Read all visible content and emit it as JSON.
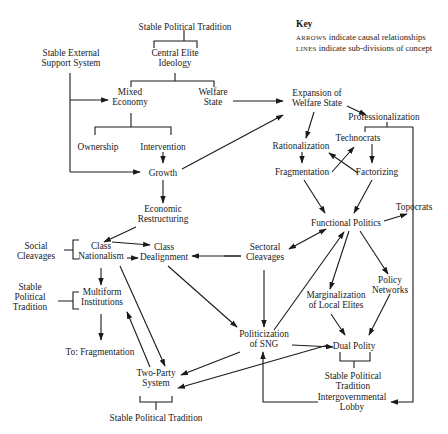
{
  "key": {
    "title": "Key",
    "lines": [
      {
        "term": "ARROWS",
        "desc": " indicate causal relationships"
      },
      {
        "term": "LINES",
        "desc": " indicate sub-divisions of concept"
      }
    ]
  },
  "nodes": [
    {
      "id": "stable_political_tradition_top",
      "lines": [
        "Stable Political Tradition"
      ],
      "x": 185,
      "y": 27
    },
    {
      "id": "central_elite_ideology",
      "lines": [
        "Central Elite",
        "Ideology"
      ],
      "x": 175,
      "y": 58
    },
    {
      "id": "stable_external_support",
      "lines": [
        "Stable External",
        "Support System"
      ],
      "x": 71,
      "y": 58
    },
    {
      "id": "mixed_economy",
      "lines": [
        "Mixed",
        "Economy"
      ],
      "x": 130,
      "y": 97
    },
    {
      "id": "welfare_state",
      "lines": [
        "Welfare",
        "State"
      ],
      "x": 213,
      "y": 97
    },
    {
      "id": "ownership",
      "lines": [
        "Ownership"
      ],
      "x": 98,
      "y": 147
    },
    {
      "id": "intervention",
      "lines": [
        "Intervention"
      ],
      "x": 163,
      "y": 147
    },
    {
      "id": "growth",
      "lines": [
        "Growth"
      ],
      "x": 163,
      "y": 173
    },
    {
      "id": "economic_restructuring",
      "lines": [
        "Economic",
        "Restructuring"
      ],
      "x": 163,
      "y": 214
    },
    {
      "id": "social_cleavages",
      "lines": [
        "Social",
        "Cleavages"
      ],
      "x": 36,
      "y": 251
    },
    {
      "id": "class_nationalism",
      "lines": [
        "Class",
        "Nationalism"
      ],
      "x": 101,
      "y": 251
    },
    {
      "id": "class_dealignment",
      "lines": [
        "Class",
        "Dealignment"
      ],
      "x": 164,
      "y": 252
    },
    {
      "id": "stable_political_tradition_left",
      "lines": [
        "Stable",
        "Political",
        "Tradition"
      ],
      "x": 30,
      "y": 297
    },
    {
      "id": "multiform_institutions",
      "lines": [
        "Multiform",
        "Institutions"
      ],
      "x": 102,
      "y": 297
    },
    {
      "id": "to_fragmentation",
      "lines": [
        "To: Fragmentation"
      ],
      "x": 100,
      "y": 352
    },
    {
      "id": "two_party_system",
      "lines": [
        "Two-Party",
        "System"
      ],
      "x": 156,
      "y": 378
    },
    {
      "id": "stable_political_tradition_bottom",
      "lines": [
        "Stable Political Tradition"
      ],
      "x": 156,
      "y": 418
    },
    {
      "id": "expansion_welfare_state",
      "lines": [
        "Expansion of",
        "Welfare State"
      ],
      "x": 317,
      "y": 98
    },
    {
      "id": "professionalization",
      "lines": [
        "Professionalization"
      ],
      "x": 384,
      "y": 117
    },
    {
      "id": "technocrats",
      "lines": [
        "Technocrats"
      ],
      "x": 358,
      "y": 138
    },
    {
      "id": "rationalization",
      "lines": [
        "Rationalization"
      ],
      "x": 301,
      "y": 146
    },
    {
      "id": "fragmentation",
      "lines": [
        "Fragmentation"
      ],
      "x": 302,
      "y": 172
    },
    {
      "id": "factorizing",
      "lines": [
        "Factorizing"
      ],
      "x": 377,
      "y": 172
    },
    {
      "id": "topocrats",
      "lines": [
        "Topocrats"
      ],
      "x": 414,
      "y": 207
    },
    {
      "id": "functional_politics",
      "lines": [
        "Functional Politics"
      ],
      "x": 346,
      "y": 223
    },
    {
      "id": "sectoral_cleavages",
      "lines": [
        "Sectoral",
        "Cleavages"
      ],
      "x": 265,
      "y": 252
    },
    {
      "id": "policy_networks",
      "lines": [
        "Policy",
        "Networks"
      ],
      "x": 390,
      "y": 285
    },
    {
      "id": "marginalization_local_elites",
      "lines": [
        "Marginalization",
        "of Local Elites"
      ],
      "x": 336,
      "y": 300
    },
    {
      "id": "politicization_sng",
      "lines": [
        "Politicization",
        "of SNG"
      ],
      "x": 264,
      "y": 339
    },
    {
      "id": "dual_polity",
      "lines": [
        "Dual Polity"
      ],
      "x": 354,
      "y": 346
    },
    {
      "id": "stable_political_tradition_right",
      "lines": [
        "Stable Political",
        "Tradition"
      ],
      "x": 353,
      "y": 381
    },
    {
      "id": "intergovernmental_lobby",
      "lines": [
        "Intergovernmental",
        "Lobby"
      ],
      "x": 352,
      "y": 402
    }
  ],
  "arrows": [
    {
      "from": "stable_external_support",
      "to": "mixed_economy",
      "path": "M70,100 L108,100"
    },
    {
      "from": "stable_external_support",
      "to": "growth",
      "path": "M70,172 L140,172"
    },
    {
      "from": "welfare_state",
      "to": "expansion_welfare_state",
      "path": "M233,101 L283,101"
    },
    {
      "from": "intervention",
      "to": "growth",
      "path": "M163,152 L163,163"
    },
    {
      "from": "growth",
      "to": "expansion_welfare_state",
      "path": "M182,169 L283,115"
    },
    {
      "from": "growth",
      "to": "economic_restructuring",
      "path": "M163,180 L163,203"
    },
    {
      "from": "economic_restructuring",
      "to": "class_nationalism",
      "path": "M136,227 L104,242"
    },
    {
      "from": "class_nationalism",
      "to": "class_dealignment",
      "path": "M112,242 L150,245"
    },
    {
      "from": "class_nationalism",
      "to": "class_dealignment",
      "path": "M127,258 L138,258"
    },
    {
      "from": "sectoral_cleavages",
      "to": "class_dealignment",
      "path": "M241,256 L192,256"
    },
    {
      "from": "class_nationalism",
      "to": "multiform_institutions",
      "path": "M101,268 L101,285"
    },
    {
      "from": "multiform_institutions",
      "to": "to_fragmentation",
      "path": "M101,314 L101,340"
    },
    {
      "from": "class_nationalism",
      "to": "two_party_system",
      "path": "M120,266 L165,366"
    },
    {
      "from": "two_party_system",
      "to": "multiform_institutions",
      "path": "M150,367 L127,312"
    },
    {
      "from": "class_dealignment",
      "to": "politicization_sng",
      "path": "M168,266 L237,327"
    },
    {
      "from": "politicization_sng",
      "to": "two_party_system",
      "path": "M240,352 L181,375"
    },
    {
      "from": "dual_polity",
      "to": "two_party_system",
      "path": "M328,345 L178,388"
    },
    {
      "from": "expansion_welfare_state",
      "to": "professionalization",
      "path": "M347,106 L366,115"
    },
    {
      "from": "expansion_welfare_state",
      "to": "rationalization",
      "path": "M314,112 L306,138"
    },
    {
      "from": "rationalization",
      "to": "fragmentation",
      "path": "M302,152 L302,163"
    },
    {
      "from": "technocrats",
      "to": "factorizing",
      "path": "M372,144 L372,163"
    },
    {
      "from": "fragmentation",
      "to": "technocrats",
      "path": "M332,172 L354,147"
    },
    {
      "from": "factorizing",
      "to": "rationalization",
      "path": "M358,173 L329,153"
    },
    {
      "from": "fragmentation",
      "to": "functional_politics",
      "path": "M304,180 L325,213"
    },
    {
      "from": "factorizing",
      "to": "functional_politics",
      "path": "M372,180 L354,213"
    },
    {
      "from": "functional_politics",
      "to": "topocrats",
      "path": "M384,221 L407,214"
    },
    {
      "from": "functional_politics",
      "to": "sectoral_cleavages",
      "path": "M326,229 L289,249",
      "double": true
    },
    {
      "from": "functional_politics",
      "to": "marginalization_local_elites",
      "path": "M349,231 L330,289"
    },
    {
      "from": "functional_politics",
      "to": "policy_networks",
      "path": "M360,231 L388,274"
    },
    {
      "from": "politicization_sng",
      "to": "functional_politics",
      "path": "M274,330 L344,232"
    },
    {
      "from": "sectoral_cleavages",
      "to": "politicization_sng",
      "path": "M264,270 L264,327"
    },
    {
      "from": "marginalization_local_elites",
      "to": "dual_polity",
      "path": "M331,314 L345,335"
    },
    {
      "from": "policy_networks",
      "to": "dual_polity",
      "path": "M390,294 L369,335"
    },
    {
      "from": "politicization_sng",
      "to": "dual_polity",
      "path": "M292,345 L333,347"
    },
    {
      "from": "intergovernmental_lobby",
      "to": "politicization_sng",
      "path": "M318,402 L263,402 L263,352"
    },
    {
      "from": "professionalization",
      "to": "intergovernmental_lobby",
      "path": "M413,127 L413,402 L391,402"
    }
  ],
  "lines": [
    {
      "concept": "stable_political_tradition_top",
      "subdivisions": [
        "central_elite_ideology"
      ],
      "path": "M184,30 L184,41 M154,48 L154,41 L197,41 L197,48"
    },
    {
      "concept": "central_elite_ideology",
      "subdivisions": [
        "mixed_economy",
        "welfare_state"
      ],
      "path": "M175,73 L175,81 M131,87 L131,81 L214,81 L214,87"
    },
    {
      "concept": "stable_external_support",
      "path": "M70,73 L70,172"
    },
    {
      "concept": "mixed_economy",
      "subdivisions": [
        "ownership",
        "intervention"
      ],
      "path": "M131,113 L131,127 M95,135 L95,127 L171,127 L171,135"
    },
    {
      "concept": "social_cleavages",
      "subdivisions": [
        "class_nationalism"
      ],
      "path": "M64,250 L73,250 M79,240 L73,240 L73,259 L79,259"
    },
    {
      "concept": "stable_political_tradition_left",
      "subdivisions": [
        "multiform_institutions"
      ],
      "path": "M58,301 L73,301 M79,292 L73,292 L73,309 L79,309"
    },
    {
      "concept": "two_party_system",
      "subdivisions": [
        "stable_political_tradition_bottom"
      ],
      "path": "M140,396 L140,402 L172,402 L172,396 M156,402 L156,410"
    },
    {
      "concept": "sectoral_cleavages",
      "subdivisions": [
        "class_dealignment_link"
      ],
      "path": "M224,256 L241,256"
    },
    {
      "concept": "professionalization",
      "subdivisions": [
        "technocrats",
        "topocrats"
      ],
      "path": "M387,122 L387,127 M365,132 L365,127 L413,127"
    },
    {
      "concept": "dual_polity",
      "subdivisions": [
        "stable_political_tradition_right"
      ],
      "path": "M340,352 L340,361 L370,361 L370,352 M354,361 L354,368"
    }
  ]
}
